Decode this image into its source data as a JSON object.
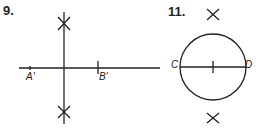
{
  "problems": [
    {
      "number": "9.",
      "points": {
        "a": "A'",
        "b": "B'"
      }
    },
    {
      "number": "11.",
      "points": {
        "c": "C",
        "d": "D"
      }
    }
  ]
}
